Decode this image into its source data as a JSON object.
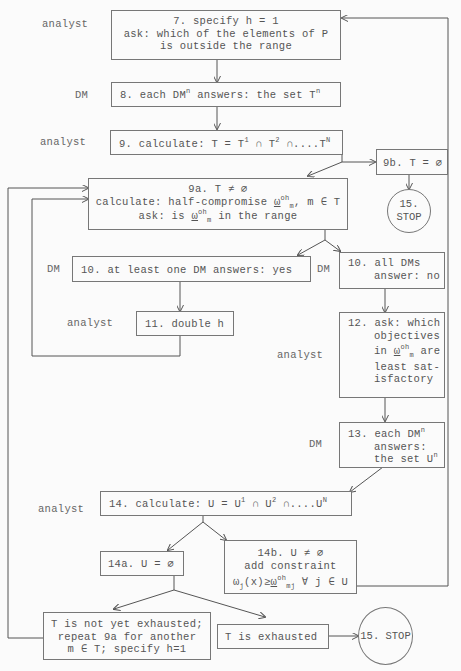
{
  "roles": {
    "analyst": "analyst",
    "dm": "DM"
  },
  "steps": {
    "s7": {
      "line1": "7. specify h = 1",
      "line2": "ask: which of the elements of P",
      "line3": "is outside the range"
    },
    "s8": {
      "pre": "8. each DM",
      "sup1": "n",
      "mid": " answers: the set T",
      "sup2": "n"
    },
    "s9": {
      "pre": "9. calculate: T = T",
      "sup1": "1",
      "mid1": " ∩ T",
      "sup2": "2",
      "mid2": " ∩....T",
      "sup3": "N"
    },
    "s9b": {
      "text": "9b. T = ∅"
    },
    "s15a": {
      "line1": "15.",
      "line2": "STOP"
    },
    "s9a": {
      "line1": "9a. T ≠ ∅",
      "line2_pre": "calculate: half-compromise ",
      "omega": "ω",
      "sup": "oh",
      "sub": "m",
      "line2_post": ", m ∈ T",
      "line3_pre": "ask: is ",
      "line3_post": " in the range"
    },
    "s10yes": {
      "text": "10. at least one DM answers: yes"
    },
    "s10no": {
      "line1": "10. all DMs",
      "line2": "answer: no"
    },
    "s11": {
      "text": "11. double h"
    },
    "s12": {
      "line1": "12. ask: which",
      "line2": "objectives",
      "line3_pre": "in ",
      "line3_post": " are",
      "line4": "least sat-",
      "line5": "isfactory"
    },
    "s13": {
      "line1_pre": "13. each DM",
      "sup1": "n",
      "line2": "answers:",
      "line3_pre": "the set U",
      "sup2": "n"
    },
    "s14": {
      "pre": "14. calculate: U = U",
      "sup1": "1",
      "mid1": " ∩ U",
      "sup2": "2",
      "mid2": " ∩....U",
      "sup3": "N"
    },
    "s14a": {
      "text": "14a. U = ∅"
    },
    "s14b": {
      "line1": "14b. U ≠ ∅",
      "line2": "add constraint",
      "line3_pre": "ω",
      "sub_j": "j",
      "line3_mid": "(x)≥",
      "sub_mj": "mj",
      "line3_post": " ∀ j ∈ U"
    },
    "notExhausted": {
      "line1": "T is not yet exhausted;",
      "line2": "repeat 9a for another",
      "line3": "m ∈ T; specify h=1"
    },
    "exhausted": {
      "text": "T is exhausted"
    },
    "s15b": {
      "text": "15. STOP"
    }
  }
}
